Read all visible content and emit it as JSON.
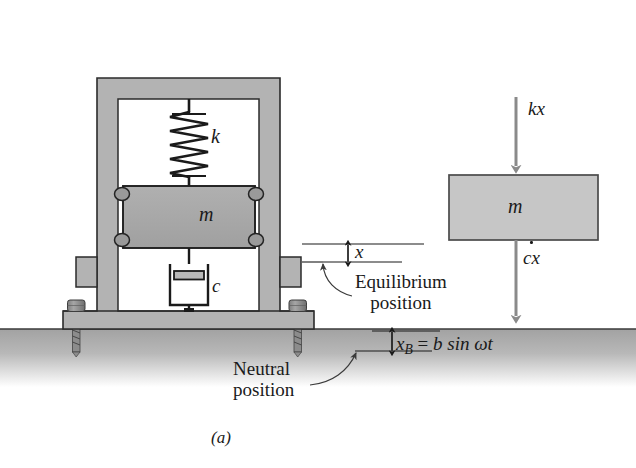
{
  "figure": {
    "caption": "(a)"
  },
  "system_diagram": {
    "spring_label": "k",
    "mass_label": "m",
    "damper_label": "c",
    "displacement_label": "x",
    "equilibrium_annotation": {
      "line1": "Equilibrium",
      "line2": "position"
    },
    "neutral_annotation": {
      "line1": "Neutral",
      "line2": "position"
    },
    "base_motion": {
      "variable": "x",
      "subscript": "B",
      "equals": "=",
      "expression": "b sin ωt",
      "full": "x_B = b sin ωt"
    }
  },
  "free_body_diagram": {
    "mass_label": "m",
    "spring_force_label": "kx",
    "damping_force_label": "cẋ",
    "damping_force_base": "cx"
  },
  "colors": {
    "frame_fill": "#b3b3b3",
    "frame_stroke": "#2b2b2b",
    "mass_fill": "#a9a9a9",
    "fbd_mass_fill": "#c6c6c6",
    "ground_fill": "#b0b0b0",
    "bolt_fill": "#999999",
    "arrow_gray": "#8a8a8a",
    "line_black": "#1a1a1a",
    "background": "#ffffff"
  }
}
